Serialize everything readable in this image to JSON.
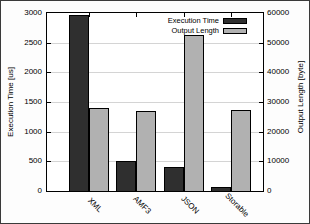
{
  "chart_data": {
    "type": "bar",
    "title": "",
    "categories": [
      "XML",
      "AMF3",
      "JSON",
      "Storable"
    ],
    "series": [
      {
        "name": "Execution Time",
        "axis": "left",
        "color": "#2f2f2f",
        "values": [
          2970,
          510,
          400,
          70
        ]
      },
      {
        "name": "Output Length",
        "axis": "right",
        "color": "#b1b1b1",
        "values": [
          27900,
          26800,
          52500,
          27200
        ]
      }
    ],
    "ylabel": "Execution Time [us]",
    "y2label": "Output Length [byte]",
    "ylim": [
      0,
      3000
    ],
    "y2lim": [
      0,
      60000
    ],
    "yticks": [
      "0",
      "500",
      "1000",
      "1500",
      "2000",
      "2500",
      "3000"
    ],
    "y2ticks": [
      "0",
      "10000",
      "20000",
      "30000",
      "40000",
      "50000",
      "60000"
    ],
    "grid": true,
    "legend_position": "top-right",
    "frame_color": "#000000",
    "grid_color": "#d4d4d4",
    "background_color": "#ffffff"
  }
}
